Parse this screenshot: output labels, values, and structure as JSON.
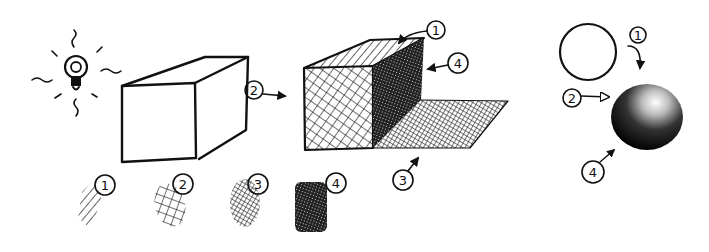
{
  "illustration": {
    "subject": "cross-hatching shading levels",
    "light_source": "lightbulb-icon",
    "swatches": [
      {
        "label": "1",
        "technique": "single hatching"
      },
      {
        "label": "2",
        "technique": "cross hatching"
      },
      {
        "label": "3",
        "technique": "denser cross hatching"
      },
      {
        "label": "4",
        "technique": "darkest multi-layer hatching"
      }
    ],
    "cube_callout": "2",
    "shaded_cube_callouts": [
      "1",
      "4",
      "3"
    ],
    "sphere_callouts": [
      "1",
      "2",
      "4"
    ]
  },
  "colors": {
    "ink": "#111111",
    "paper": "#ffffff"
  }
}
